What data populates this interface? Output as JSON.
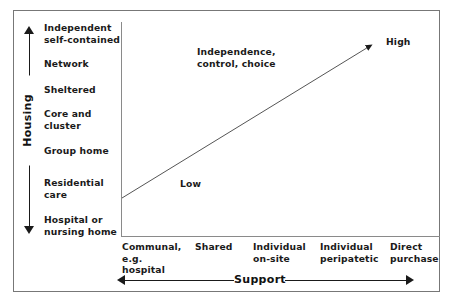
{
  "diagram": {
    "y_axis": {
      "label": "Housing",
      "arrow": "double-headed-vertical",
      "categories": [
        {
          "label": "Independent\nself-contained",
          "line1": "Independent",
          "line2": "self-contained",
          "top": 22
        },
        {
          "label": "Network",
          "line1": "Network",
          "line2": "",
          "top": 58
        },
        {
          "label": "Sheltered",
          "line1": "Sheltered",
          "line2": "",
          "top": 84
        },
        {
          "label": "Core and\ncluster",
          "line1": "Core and",
          "line2": "cluster",
          "top": 108
        },
        {
          "label": "Group home",
          "line1": "Group home",
          "line2": "",
          "top": 145
        },
        {
          "label": "Residential\ncare",
          "line1": "Residential",
          "line2": "care",
          "top": 177
        },
        {
          "label": "Hospital or\nnursing home",
          "line1": "Hospital or",
          "line2": "nursing home",
          "top": 214
        }
      ]
    },
    "x_axis": {
      "label": "Support",
      "arrow": "double-headed-horizontal",
      "categories": [
        {
          "label": "Communal, e.g. hospital",
          "line1": "Communal,",
          "line2": "e.g.",
          "line3": "hospital",
          "left": 122,
          "width": 70
        },
        {
          "label": "Shared",
          "line1": "Shared",
          "line2": "",
          "line3": "",
          "left": 195,
          "width": 55
        },
        {
          "label": "Individual on-site",
          "line1": "Individual",
          "line2": "on-site",
          "line3": "",
          "left": 253,
          "width": 62
        },
        {
          "label": "Individual peripatetic",
          "line1": "Individual",
          "line2": "peripatetic",
          "line3": "",
          "left": 320,
          "width": 68
        },
        {
          "label": "Direct purchase",
          "line1": "Direct",
          "line2": "purchase",
          "line3": "",
          "left": 390,
          "width": 56
        }
      ]
    },
    "annotations": {
      "gradient_label": "Independence,\ncontrol, choice",
      "gradient_label_line1": "Independence,",
      "gradient_label_line2": "control, choice",
      "low": "Low",
      "high": "High"
    },
    "trend_arrow": {
      "description": "diagonal arrow from lower-left to upper-right",
      "start_x": 122,
      "start_y": 198,
      "end_x": 373,
      "end_y": 44
    },
    "colors": {
      "line": "#1a1a1a",
      "axis": "#8a8a8a",
      "frame": "#777777",
      "text": "#1a1a1a",
      "background": "#ffffff"
    }
  }
}
